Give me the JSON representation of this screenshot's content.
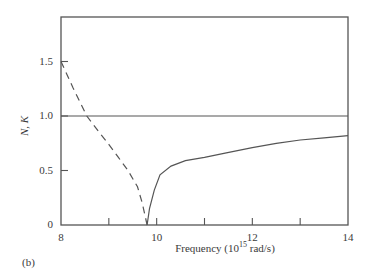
{
  "chart_data": {
    "type": "line",
    "title": "",
    "panel_label": "(b)",
    "xlabel": "Frequency (10¹⁵ rad/s)",
    "ylabel": "N, K",
    "xlim": [
      8,
      14
    ],
    "ylim": [
      0,
      1.9
    ],
    "xticks": [
      8,
      9,
      10,
      11,
      12,
      13,
      14
    ],
    "xtick_labels": [
      "8",
      "",
      "10",
      "",
      "12",
      "",
      "14"
    ],
    "yticks": [
      0,
      0.5,
      1.0,
      1.5
    ],
    "ytick_labels": [
      "0",
      "0.5",
      "1.0",
      "1.5"
    ],
    "grid": false,
    "legend": null,
    "series": [
      {
        "name": "N (dashed)",
        "style": "dashed",
        "x": [
          8.0,
          8.25,
          8.54,
          8.8,
          9.0,
          9.2,
          9.4,
          9.6,
          9.7,
          9.8
        ],
        "y": [
          1.5,
          1.26,
          1.0,
          0.85,
          0.74,
          0.62,
          0.5,
          0.35,
          0.2,
          0.0
        ]
      },
      {
        "name": "K (solid)",
        "style": "solid",
        "x": [
          9.8,
          9.85,
          9.95,
          10.07,
          10.3,
          10.6,
          11.0,
          11.43,
          12.0,
          12.5,
          13.0,
          13.5,
          14.0
        ],
        "y": [
          0.0,
          0.15,
          0.32,
          0.46,
          0.54,
          0.59,
          0.62,
          0.66,
          0.71,
          0.75,
          0.78,
          0.8,
          0.82
        ]
      },
      {
        "name": "reference 1.0",
        "style": "solid",
        "x": [
          8,
          14
        ],
        "y": [
          1.0,
          1.0
        ]
      }
    ]
  }
}
